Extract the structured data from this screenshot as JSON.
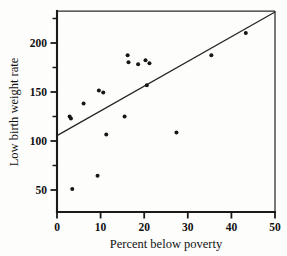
{
  "chart_data": {
    "type": "scatter",
    "title": "",
    "xlabel": "Percent below poverty",
    "ylabel": "Low birth weight rate",
    "xlim": [
      0,
      50
    ],
    "ylim": [
      25,
      225
    ],
    "grid": false,
    "legend": null,
    "x_ticks": [
      0,
      10,
      20,
      30,
      40,
      50
    ],
    "x_tick_labels": [
      "0",
      "10",
      "20",
      "30",
      "40",
      "50"
    ],
    "y_ticks": [
      50,
      100,
      150,
      200
    ],
    "y_tick_labels": [
      "50",
      "100",
      "150",
      "200"
    ],
    "y_minor_ticks": [
      75,
      125,
      175,
      225
    ],
    "points": [
      {
        "x": 2.9,
        "y": 120
      },
      {
        "x": 3.2,
        "y": 118
      },
      {
        "x": 3.5,
        "y": 48
      },
      {
        "x": 6.1,
        "y": 133
      },
      {
        "x": 9.3,
        "y": 61
      },
      {
        "x": 9.6,
        "y": 146
      },
      {
        "x": 10.6,
        "y": 144
      },
      {
        "x": 11.3,
        "y": 102
      },
      {
        "x": 15.5,
        "y": 120
      },
      {
        "x": 16.2,
        "y": 181
      },
      {
        "x": 16.4,
        "y": 174
      },
      {
        "x": 18.6,
        "y": 172
      },
      {
        "x": 20.3,
        "y": 176
      },
      {
        "x": 20.6,
        "y": 151
      },
      {
        "x": 21.2,
        "y": 173
      },
      {
        "x": 27.4,
        "y": 104
      },
      {
        "x": 35.4,
        "y": 181
      },
      {
        "x": 43.3,
        "y": 203
      }
    ],
    "fit_line": {
      "type": "linear-regression",
      "x_start": 0,
      "y_start": 101,
      "x_end": 50,
      "y_end": 224
    },
    "colors": {
      "point": "#161616",
      "line": "#242424",
      "axis": "#1a1a1a",
      "background": "#fdfdfc"
    },
    "point_size": 2.0
  }
}
